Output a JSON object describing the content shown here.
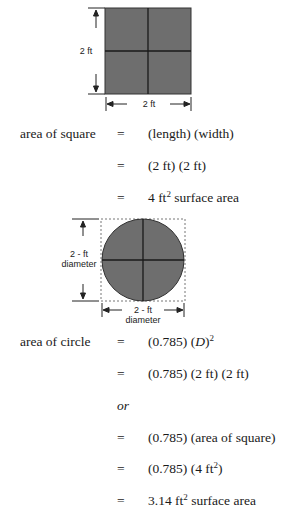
{
  "square_figure": {
    "side_label_vertical": "2 ft",
    "side_label_horizontal": "2 ft",
    "fill_color": "#6e6e6e",
    "line_color": "#1a1a1a"
  },
  "square_equations": [
    {
      "label": "area of square",
      "eq": "=",
      "value": "(length) (width)"
    },
    {
      "label": "",
      "eq": "=",
      "value": "(2 ft) (2 ft)"
    },
    {
      "label": "",
      "eq": "=",
      "value_prefix": "4 ft",
      "value_sup": "2",
      "value_suffix": " surface area"
    }
  ],
  "circle_figure": {
    "diameter_label_vertical_line1": "2 - ft",
    "diameter_label_vertical_line2": "diameter",
    "diameter_label_horizontal_line1": "2 - ft",
    "diameter_label_horizontal_line2": "diameter",
    "fill_color": "#6e6e6e",
    "dashed_border_color": "#777777"
  },
  "circle_equations": [
    {
      "label": "area of circle",
      "eq": "=",
      "value_prefix": "(0.785) (",
      "value_italic": "D",
      "value_mid": ")",
      "value_sup": "2"
    },
    {
      "label": "",
      "eq": "=",
      "value": "(0.785) (2 ft) (2 ft)"
    },
    {
      "or": "or"
    },
    {
      "label": "",
      "eq": "=",
      "value": "(0.785) (area of square)"
    },
    {
      "label": "",
      "eq": "=",
      "value_prefix": "(0.785) (4 ft",
      "value_sup": "2",
      "value_suffix": ")"
    },
    {
      "label": "",
      "eq": "=",
      "value_prefix": "3.14 ft",
      "value_sup": "2",
      "value_suffix": " surface area"
    }
  ]
}
